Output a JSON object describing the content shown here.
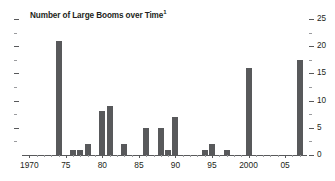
{
  "chart_data": {
    "type": "bar",
    "title": "Number of Large Booms over Time",
    "title_footnote": "1",
    "xlabel": "",
    "ylabel": "",
    "ylim": [
      0,
      25
    ],
    "y_major_ticks": [
      0,
      5,
      10,
      15,
      20,
      25
    ],
    "y_minor_ticks": [
      2.5,
      7.5,
      12.5,
      17.5,
      22.5
    ],
    "y_axis_position": "right",
    "grid": false,
    "legend": null,
    "bar_color": "#58595b",
    "x_tick_labels": [
      "1970",
      "75",
      "80",
      "85",
      "90",
      "95",
      "2000",
      "05"
    ],
    "x_tick_years": [
      1970,
      1975,
      1980,
      1985,
      1990,
      1995,
      2000,
      2005
    ],
    "x_range": [
      1969,
      2008
    ],
    "categories": [
      1970,
      1971,
      1972,
      1973,
      1974,
      1975,
      1976,
      1977,
      1978,
      1979,
      1980,
      1981,
      1982,
      1983,
      1984,
      1985,
      1986,
      1987,
      1988,
      1989,
      1990,
      1991,
      1992,
      1993,
      1994,
      1995,
      1996,
      1997,
      1998,
      1999,
      2000,
      2001,
      2002,
      2003,
      2004,
      2005,
      2006,
      2007
    ],
    "values": [
      0,
      0,
      0,
      0,
      21,
      0,
      1,
      1,
      2,
      0,
      8,
      9,
      0,
      2,
      0,
      0,
      5,
      0,
      5,
      1,
      7,
      0,
      0,
      0,
      1,
      2,
      0,
      1,
      0,
      0,
      16,
      0,
      0,
      0,
      0,
      0,
      0,
      17.5
    ]
  },
  "y_axis_labels": [
    "25",
    "20",
    "15",
    "10",
    "5",
    "0"
  ]
}
